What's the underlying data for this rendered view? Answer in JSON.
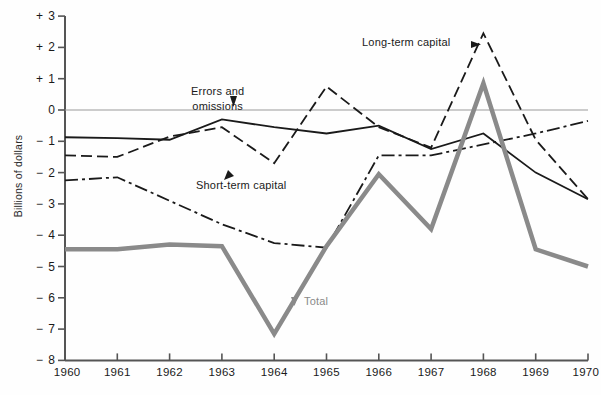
{
  "axes": {
    "ylabel": "Billions of dollars",
    "yticks": [
      "+ 3",
      "+ 2",
      "+ 1",
      "0",
      "− 1",
      "− 2",
      "− 3",
      "− 4",
      "− 5",
      "− 6",
      "− 7",
      "− 8"
    ],
    "xticks": [
      "1960",
      "1961",
      "1962",
      "1963",
      "1964",
      "1965",
      "1966",
      "1967",
      "1968",
      "1969",
      "1970"
    ]
  },
  "annotations": {
    "errors": "Errors and\nomissions",
    "errors_line1": "Errors and",
    "errors_line2": "omissions",
    "longterm": "Long-term capital",
    "shortterm": "Short-term capital",
    "total": "Total"
  },
  "colors": {
    "line_black": "#1a1a1a",
    "line_gray": "#8a8a8a",
    "axis": "#555555",
    "zero_line": "#999999",
    "background": "#fefefe"
  },
  "chart_data": {
    "type": "line",
    "title": "",
    "xlabel": "",
    "ylabel": "Billions of dollars",
    "x": [
      1960,
      1961,
      1962,
      1963,
      1964,
      1965,
      1966,
      1967,
      1968,
      1969,
      1970
    ],
    "xlim": [
      1960,
      1970
    ],
    "ylim": [
      -8,
      3
    ],
    "ytick_values": [
      3,
      2,
      1,
      0,
      -1,
      -2,
      -3,
      -4,
      -5,
      -6,
      -7,
      -8
    ],
    "grid": false,
    "legend": "inline-annotations",
    "zero_line": true,
    "series": [
      {
        "name": "Errors and omissions",
        "style": "solid",
        "color": "#1a1a1a",
        "width": 1.8,
        "values": [
          -0.87,
          -0.9,
          -0.95,
          -0.3,
          -0.55,
          -0.75,
          -0.5,
          -1.25,
          -0.75,
          -2.0,
          -2.85
        ]
      },
      {
        "name": "Long-term capital",
        "style": "dashed",
        "color": "#1a1a1a",
        "width": 1.8,
        "values": [
          -1.45,
          -1.5,
          -0.85,
          -0.55,
          -1.7,
          0.75,
          -0.55,
          -1.2,
          2.45,
          -0.95,
          -2.85
        ]
      },
      {
        "name": "Short-term capital",
        "style": "dash-dot",
        "color": "#1a1a1a",
        "width": 1.8,
        "values": [
          -2.25,
          -2.15,
          -2.9,
          -3.65,
          -4.25,
          -4.4,
          -1.45,
          -1.45,
          -1.1,
          -0.75,
          -0.35
        ]
      },
      {
        "name": "Total",
        "style": "solid-thick",
        "color": "#8a8a8a",
        "width": 4.5,
        "values": [
          -4.45,
          -4.45,
          -4.3,
          -4.35,
          -7.15,
          -4.35,
          -2.05,
          -3.8,
          0.85,
          -4.45,
          -5.0
        ]
      }
    ]
  }
}
